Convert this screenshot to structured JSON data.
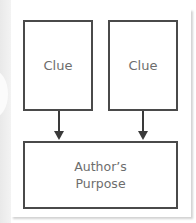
{
  "diagram": {
    "type": "flowchart",
    "nodes": [
      {
        "id": "clue_1",
        "label": "Clue"
      },
      {
        "id": "clue_2",
        "label": "Clue"
      },
      {
        "id": "authors_purpose",
        "label_line1": "Author’s",
        "label_line2": "Purpose"
      }
    ],
    "edges": [
      {
        "from": "clue_1",
        "to": "authors_purpose"
      },
      {
        "from": "clue_2",
        "to": "authors_purpose"
      }
    ],
    "colors": {
      "border": "#4a4a4a",
      "text": "#6d6d6d",
      "arrow": "#3a3a3a",
      "background": "#ffffff"
    }
  }
}
